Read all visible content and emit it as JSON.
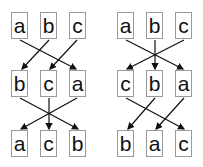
{
  "diagrams": [
    {
      "rows": [
        [
          "a",
          "b",
          "c"
        ],
        [
          "b",
          "c",
          "a"
        ],
        [
          "a",
          "c",
          "b"
        ]
      ]
    },
    {
      "rows": [
        [
          "a",
          "b",
          "c"
        ],
        [
          "c",
          "b",
          "a"
        ],
        [
          "b",
          "a",
          "c"
        ]
      ]
    }
  ],
  "colors": {
    "box_border": "#9a9a9a",
    "arrow": "#111111",
    "text": "#111111"
  }
}
